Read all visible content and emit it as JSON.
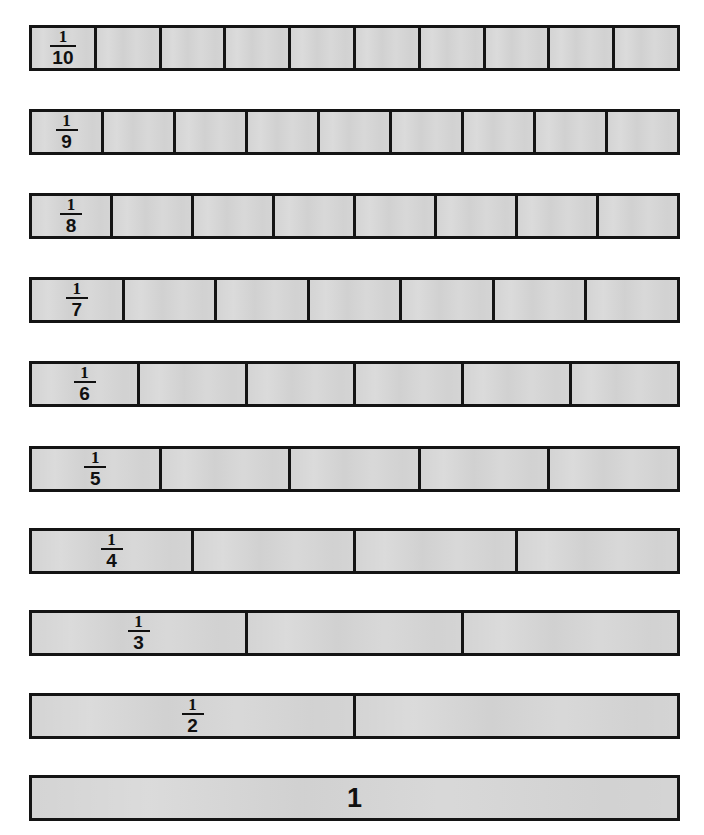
{
  "page": {
    "background_color": "#ffffff",
    "bar_fill_color": "#d4d4d4",
    "bar_border_color": "#141414",
    "text_color": "#101010"
  },
  "chart_data": {
    "type": "bar",
    "xlabel": "",
    "ylabel": "",
    "grid": false,
    "legend": null,
    "bar_total_width_fraction": 1.0,
    "rows": [
      {
        "label": "1/10",
        "numerator": "1",
        "denominator": "10",
        "segments": 10,
        "segment_value": 0.1,
        "display": "fraction",
        "top": 25
      },
      {
        "label": "1/9",
        "numerator": "1",
        "denominator": "9",
        "segments": 9,
        "segment_value": 0.1111,
        "display": "fraction",
        "top": 109
      },
      {
        "label": "1/8",
        "numerator": "1",
        "denominator": "8",
        "segments": 8,
        "segment_value": 0.125,
        "display": "fraction",
        "top": 193
      },
      {
        "label": "1/7",
        "numerator": "1",
        "denominator": "7",
        "segments": 7,
        "segment_value": 0.1429,
        "display": "fraction",
        "top": 277
      },
      {
        "label": "1/6",
        "numerator": "1",
        "denominator": "6",
        "segments": 6,
        "segment_value": 0.1667,
        "display": "fraction",
        "top": 361
      },
      {
        "label": "1/5",
        "numerator": "1",
        "denominator": "5",
        "segments": 5,
        "segment_value": 0.2,
        "display": "fraction",
        "top": 446
      },
      {
        "label": "1/4",
        "numerator": "1",
        "denominator": "4",
        "segments": 4,
        "segment_value": 0.25,
        "display": "fraction",
        "top": 528
      },
      {
        "label": "1/3",
        "numerator": "1",
        "denominator": "3",
        "segments": 3,
        "segment_value": 0.3333,
        "display": "fraction",
        "top": 610
      },
      {
        "label": "1/2",
        "numerator": "1",
        "denominator": "2",
        "segments": 2,
        "segment_value": 0.5,
        "display": "fraction",
        "top": 693
      },
      {
        "label": "1",
        "numerator": "1",
        "denominator": "",
        "segments": 1,
        "segment_value": 1.0,
        "display": "whole",
        "whole_label": "1",
        "top": 775
      }
    ]
  }
}
